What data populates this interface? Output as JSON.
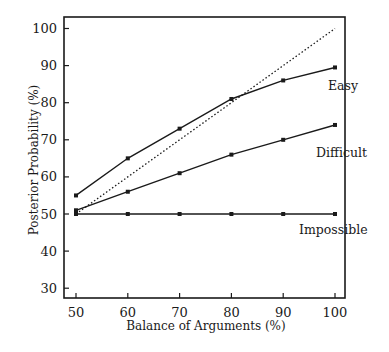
{
  "chart_data": {
    "type": "line",
    "title": "",
    "xlabel": "Balance of Arguments (%)",
    "ylabel": "Posterior Probability (%)",
    "x": [
      50,
      60,
      70,
      80,
      90,
      100
    ],
    "xlim": [
      50,
      100
    ],
    "ylim": [
      27,
      103
    ],
    "xticks": [
      50,
      60,
      70,
      80,
      90,
      100
    ],
    "yticks": [
      30,
      40,
      50,
      60,
      70,
      80,
      90,
      100
    ],
    "grid": false,
    "legend_position": "inline labels at right end of each line",
    "series": [
      {
        "name": "Easy",
        "values": [
          55,
          65,
          73,
          81,
          86,
          89.5
        ],
        "style": "solid",
        "markers": true
      },
      {
        "name": "Difficult",
        "values": [
          51,
          56,
          61,
          66,
          70,
          74
        ],
        "style": "solid",
        "markers": true
      },
      {
        "name": "Impossible",
        "values": [
          50,
          50,
          50,
          50,
          50,
          50
        ],
        "style": "solid",
        "markers": true
      },
      {
        "name": "Diagonal (x = y)",
        "values": [
          50,
          60,
          70,
          80,
          90,
          100
        ],
        "style": "dotted",
        "markers": false
      }
    ],
    "annotations": [
      {
        "text": "Easy",
        "near_series": "Easy"
      },
      {
        "text": "Difficult",
        "near_series": "Difficult"
      },
      {
        "text": "Impossible",
        "near_series": "Impossible"
      }
    ]
  },
  "labels": {
    "xlabel": "Balance of Arguments (%)",
    "ylabel": "Posterior Probability (%)",
    "easy": "Easy",
    "difficult": "Difficult",
    "impossible": "Impossible"
  },
  "colors": {
    "line": "#1a1a1a",
    "background": "#ffffff"
  }
}
